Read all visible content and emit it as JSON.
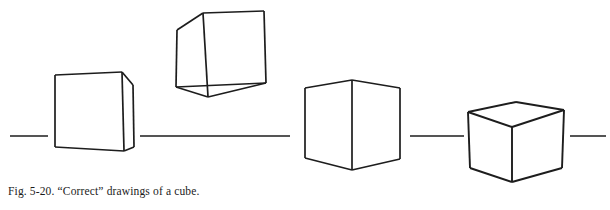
{
  "figure": {
    "label": "Fig. 5-20.",
    "caption": "Fig. 5-20. “Correct” drawings of a cube.",
    "caption_title": "“Correct” drawings of a cube.",
    "subject": "cube",
    "count_of_drawings": 4,
    "ink_color": "#1d1d1d",
    "paper_color": "#ffffff"
  },
  "horizon": {
    "name": "horizon-line",
    "y": 136,
    "stroke_width": 1.6,
    "segments": [
      {
        "id": "horizon-segment-1",
        "x1": 10,
        "x2": 48,
        "y": 136
      },
      {
        "id": "horizon-segment-2",
        "x1": 140,
        "x2": 290,
        "y": 136
      },
      {
        "id": "horizon-segment-3",
        "x1": 410,
        "x2": 464,
        "y": 136
      },
      {
        "id": "horizon-segment-4",
        "x1": 570,
        "x2": 606,
        "y": 136
      }
    ]
  },
  "cubes": [
    {
      "id": "cube-1",
      "name": "cube-drawing-near-frontal",
      "description": "Near-frontal cube, slight right-side face visible, sits on the horizon",
      "stroke_width": 1.7,
      "front_face": [
        [
          55,
          75
        ],
        [
          122,
          72
        ],
        [
          124,
          151
        ],
        [
          55,
          147
        ]
      ],
      "side_face": [
        [
          122,
          72
        ],
        [
          133,
          85
        ],
        [
          134,
          147
        ],
        [
          124,
          151
        ]
      ],
      "edges": [
        [
          [
            55,
            75
          ],
          [
            122,
            72
          ]
        ],
        [
          [
            122,
            72
          ],
          [
            124,
            151
          ]
        ],
        [
          [
            124,
            151
          ],
          [
            55,
            147
          ]
        ],
        [
          [
            55,
            147
          ],
          [
            55,
            75
          ]
        ],
        [
          [
            122,
            72
          ],
          [
            133,
            85
          ]
        ],
        [
          [
            133,
            85
          ],
          [
            134,
            147
          ]
        ],
        [
          [
            134,
            147
          ],
          [
            124,
            151
          ]
        ]
      ]
    },
    {
      "id": "cube-2",
      "name": "cube-drawing-tilted-above",
      "description": "Tilted cube floating above the horizon, seen from above showing bottom-left three-quarter view",
      "stroke_width": 1.7,
      "edges": [
        [
          [
            203,
            13
          ],
          [
            264,
            11
          ]
        ],
        [
          [
            264,
            11
          ],
          [
            266,
            83
          ]
        ],
        [
          [
            266,
            83
          ],
          [
            208,
            97
          ]
        ],
        [
          [
            208,
            97
          ],
          [
            203,
            13
          ]
        ],
        [
          [
            203,
            13
          ],
          [
            177,
            30
          ]
        ],
        [
          [
            177,
            30
          ],
          [
            176,
            87
          ]
        ],
        [
          [
            176,
            87
          ],
          [
            208,
            97
          ]
        ],
        [
          [
            176,
            87
          ],
          [
            266,
            83
          ]
        ]
      ]
    },
    {
      "id": "cube-3",
      "name": "cube-drawing-two-point-perspective",
      "description": "Two-point perspective cube with vertical near edge on the horizon, both side faces visible",
      "stroke_width": 1.7,
      "edges": [
        [
          [
            352,
            80
          ],
          [
            305,
            88
          ]
        ],
        [
          [
            305,
            88
          ],
          [
            305,
            158
          ]
        ],
        [
          [
            305,
            158
          ],
          [
            352,
            170
          ]
        ],
        [
          [
            352,
            170
          ],
          [
            352,
            80
          ]
        ],
        [
          [
            352,
            80
          ],
          [
            400,
            88
          ]
        ],
        [
          [
            400,
            88
          ],
          [
            400,
            159
          ]
        ],
        [
          [
            400,
            159
          ],
          [
            352,
            170
          ]
        ]
      ]
    },
    {
      "id": "cube-4",
      "name": "cube-drawing-below-horizon",
      "description": "Cube below the horizon line, top face visible, two-point perspective",
      "stroke_width": 1.9,
      "edges": [
        [
          [
            468,
            112
          ],
          [
            516,
            102
          ]
        ],
        [
          [
            516,
            102
          ],
          [
            564,
            110
          ]
        ],
        [
          [
            564,
            110
          ],
          [
            512,
            127
          ]
        ],
        [
          [
            512,
            127
          ],
          [
            468,
            112
          ]
        ],
        [
          [
            468,
            112
          ],
          [
            470,
            168
          ]
        ],
        [
          [
            470,
            168
          ],
          [
            512,
            182
          ]
        ],
        [
          [
            512,
            182
          ],
          [
            512,
            127
          ]
        ],
        [
          [
            564,
            110
          ],
          [
            562,
            168
          ]
        ],
        [
          [
            562,
            168
          ],
          [
            512,
            182
          ]
        ]
      ]
    }
  ]
}
